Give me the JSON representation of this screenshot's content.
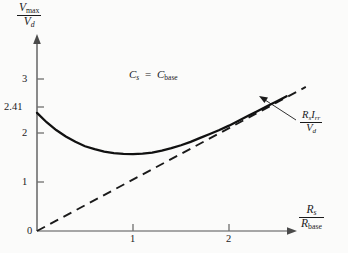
{
  "figure": {
    "background_color": "#fbfbfa",
    "ink_color": "#1a1a1a"
  },
  "axes": {
    "ylabel_numerator": "V",
    "ylabel_numerator_sub": "max",
    "ylabel_denominator": "V",
    "ylabel_denominator_sub": "d",
    "xlabel_numerator": "R",
    "xlabel_numerator_sub": "s",
    "xlabel_denominator": "R",
    "xlabel_denominator_sub": "base",
    "origin_label": "0",
    "yticks": [
      "1",
      "2",
      "2.41",
      "3"
    ],
    "xticks": [
      "1",
      "2"
    ]
  },
  "annotations": {
    "condition_lhs": "C",
    "condition_lhs_sub": "s",
    "condition_eq": "=",
    "condition_rhs": "C",
    "condition_rhs_sub": "base",
    "asymptote_num_r": "R",
    "asymptote_num_r_sub": "s",
    "asymptote_num_i": "I",
    "asymptote_num_i_sub": "rr",
    "asymptote_den": "V",
    "asymptote_den_sub": "d"
  },
  "chart_data": {
    "type": "line",
    "title": "",
    "xlabel": "R_s / R_base",
    "ylabel": "V_max / V_d",
    "xlim": [
      0,
      2.85
    ],
    "ylim": [
      0,
      3.3
    ],
    "grid": false,
    "legend": null,
    "xticks": [
      1,
      2
    ],
    "yticks": [
      1,
      2,
      2.41,
      3
    ],
    "annotations": [
      {
        "text": "C_s = C_base",
        "x": 1.0,
        "y": 2.95
      },
      {
        "text": "R_s I_rr / V_d",
        "x": 2.75,
        "y": 2.0,
        "points_to": [
          2.35,
          2.42
        ]
      }
    ],
    "series": [
      {
        "name": "V_max / V_d",
        "style": "solid",
        "x": [
          0.0,
          0.1,
          0.2,
          0.3,
          0.4,
          0.5,
          0.6,
          0.7,
          0.8,
          0.9,
          1.0,
          1.1,
          1.2,
          1.3,
          1.4,
          1.5,
          1.6,
          1.7,
          1.8,
          1.9,
          2.0,
          2.1,
          2.2,
          2.3,
          2.4,
          2.5,
          2.6
        ],
        "y": [
          2.41,
          2.22,
          2.06,
          1.93,
          1.82,
          1.73,
          1.67,
          1.62,
          1.59,
          1.575,
          1.57,
          1.58,
          1.6,
          1.64,
          1.69,
          1.75,
          1.82,
          1.9,
          1.98,
          2.06,
          2.15,
          2.25,
          2.35,
          2.45,
          2.55,
          2.65,
          2.75
        ]
      },
      {
        "name": "R_s I_rr / V_d asymptote",
        "style": "dashed",
        "x": [
          0.0,
          2.8
        ],
        "y": [
          0.0,
          2.94
        ]
      }
    ]
  }
}
